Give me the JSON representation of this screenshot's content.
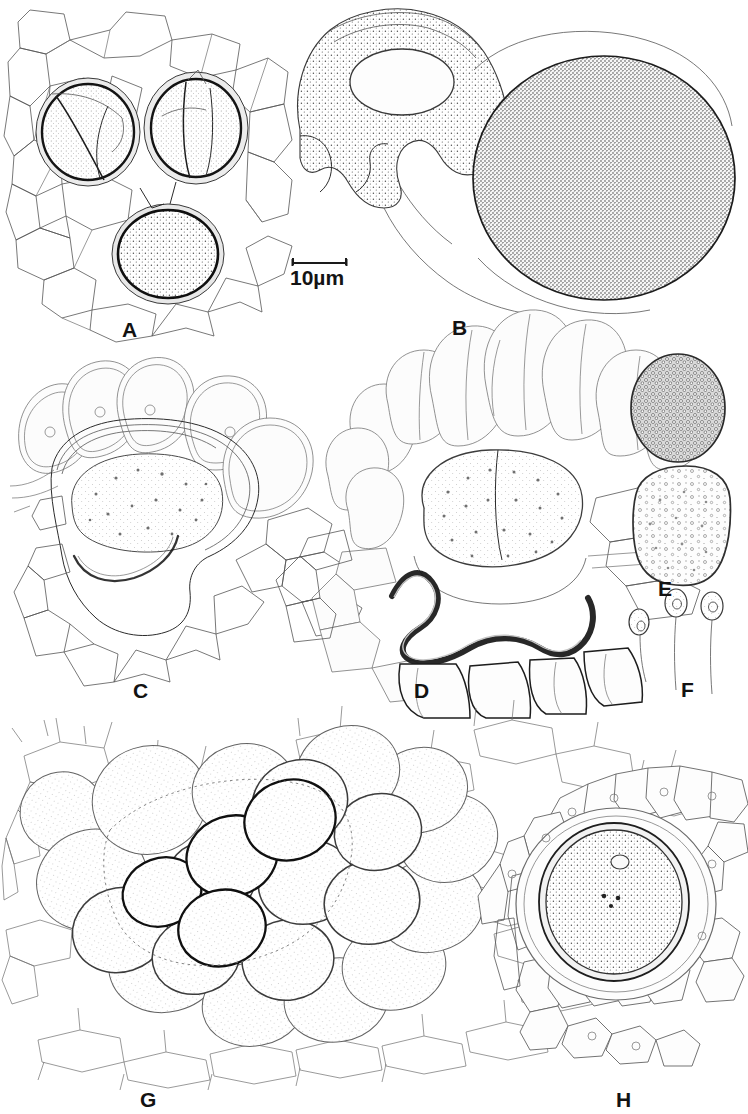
{
  "figure": {
    "type": "scientific-illustration-plate",
    "medium": "ink line drawing",
    "background_color": "#ffffff",
    "ink_color": "#2b2b2b",
    "panel_count": 8,
    "width_px": 748,
    "height_px": 1114
  },
  "scale_bar": {
    "label": "10µm",
    "value": 10,
    "unit": "µm",
    "bar_length_px": 55,
    "position": {
      "x": 290,
      "y": 258
    }
  },
  "panels": [
    {
      "id": "A",
      "label": "A",
      "label_pos": {
        "x": 122,
        "y": 319
      },
      "caption": "Three ovoid spore-bearing cells embedded in a network of angular epidermal cells",
      "subject_count": 3
    },
    {
      "id": "B",
      "label": "B",
      "label_pos": {
        "x": 452,
        "y": 317
      },
      "caption": "Lobed cell with inner vesicle adjacent to a large densely punctate spherical spore",
      "subject_count": 2
    },
    {
      "id": "C",
      "label": "C",
      "label_pos": {
        "x": 133,
        "y": 680
      },
      "caption": "Perianth / involucre in section with crowned ring of club-shaped lobes and a granular capsule",
      "subject_count": 1
    },
    {
      "id": "D",
      "label": "D",
      "label_pos": {
        "x": 414,
        "y": 680
      },
      "caption": "Similar structure in side view with thickened dark undulating basal wall",
      "subject_count": 1
    },
    {
      "id": "E",
      "label": "E",
      "label_pos": {
        "x": 658,
        "y": 578
      },
      "caption": "Dark verrucose ovoid spore (upper) and pale dome-shaped cell with scattered papillae (lower)",
      "subject_count": 2
    },
    {
      "id": "F",
      "label": "F",
      "label_pos": {
        "x": 681,
        "y": 679
      },
      "caption": "Three stalked gemmae / slime papillae of increasing height",
      "subject_count": 3
    },
    {
      "id": "G",
      "label": "G",
      "label_pos": {
        "x": 140,
        "y": 1089
      },
      "caption": "Surface view of an imbricate cluster of rounded leaves over a field of angular cells",
      "subject_count": 1
    },
    {
      "id": "H",
      "label": "H",
      "label_pos": {
        "x": 616,
        "y": 1089
      },
      "caption": "Single ovoid spore surrounded by a hyaline ring of radiating cells",
      "subject_count": 1
    }
  ]
}
